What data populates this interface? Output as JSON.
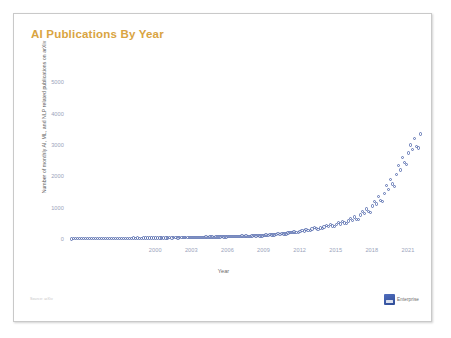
{
  "slide": {
    "title": "AI Publications By Year",
    "title_color": "#d9a441",
    "source_note": "Source: arXiv",
    "logo_text": "Enterprise",
    "logo_mark_name": "company-logo-mark",
    "background_color": "#ffffff",
    "frame_border_color": "#c9c9c9"
  },
  "chart_data": {
    "type": "scatter",
    "title": "AI Publications By Year",
    "xlabel": "Year",
    "ylabel": "Number of monthly AI, ML, and NLP related publications on arXiv",
    "marker_color": "#5d72b2",
    "marker_style": "open-circle",
    "grid": false,
    "legend": "none",
    "xlim": [
      1993,
      2022.5
    ],
    "ylim": [
      0,
      5300
    ],
    "xticks": [
      2000,
      2003,
      2006,
      2009,
      2012,
      2015,
      2018,
      2021
    ],
    "yticks": [
      0,
      1000,
      2000,
      3000,
      4000,
      5000
    ],
    "x": [
      1993.04,
      1993.21,
      1993.38,
      1993.54,
      1993.71,
      1993.88,
      1994.04,
      1994.21,
      1994.38,
      1994.54,
      1994.71,
      1994.88,
      1995.04,
      1995.21,
      1995.38,
      1995.54,
      1995.71,
      1995.88,
      1996.04,
      1996.21,
      1996.38,
      1996.54,
      1996.71,
      1996.88,
      1997.04,
      1997.21,
      1997.38,
      1997.54,
      1997.71,
      1997.88,
      1998.04,
      1998.21,
      1998.38,
      1998.54,
      1998.71,
      1998.88,
      1999.04,
      1999.21,
      1999.38,
      1999.54,
      1999.71,
      1999.88,
      2000.04,
      2000.21,
      2000.38,
      2000.54,
      2000.71,
      2000.88,
      2001.04,
      2001.21,
      2001.38,
      2001.54,
      2001.71,
      2001.88,
      2002.04,
      2002.21,
      2002.38,
      2002.54,
      2002.71,
      2002.88,
      2003.04,
      2003.21,
      2003.38,
      2003.54,
      2003.71,
      2003.88,
      2004.04,
      2004.21,
      2004.38,
      2004.54,
      2004.71,
      2004.88,
      2005.04,
      2005.21,
      2005.38,
      2005.54,
      2005.71,
      2005.88,
      2006.04,
      2006.21,
      2006.38,
      2006.54,
      2006.71,
      2006.88,
      2007.04,
      2007.21,
      2007.38,
      2007.54,
      2007.71,
      2007.88,
      2008.04,
      2008.21,
      2008.38,
      2008.54,
      2008.71,
      2008.88,
      2009.04,
      2009.21,
      2009.38,
      2009.54,
      2009.71,
      2009.88,
      2010.04,
      2010.21,
      2010.38,
      2010.54,
      2010.71,
      2010.88,
      2011.04,
      2011.21,
      2011.38,
      2011.54,
      2011.71,
      2011.88,
      2012.04,
      2012.21,
      2012.38,
      2012.54,
      2012.71,
      2012.88,
      2013.04,
      2013.21,
      2013.38,
      2013.54,
      2013.71,
      2013.88,
      2014.04,
      2014.21,
      2014.38,
      2014.54,
      2014.71,
      2014.88,
      2015.04,
      2015.21,
      2015.38,
      2015.54,
      2015.71,
      2015.88,
      2016.04,
      2016.21,
      2016.38,
      2016.54,
      2016.71,
      2016.88,
      2017.04,
      2017.21,
      2017.38,
      2017.54,
      2017.71,
      2017.88,
      2018.04,
      2018.21,
      2018.38,
      2018.54,
      2018.71,
      2018.88,
      2019.04,
      2019.21,
      2019.38,
      2019.54,
      2019.71,
      2019.88,
      2020.04,
      2020.21,
      2020.38,
      2020.54,
      2020.71,
      2020.88,
      2021.04,
      2021.21,
      2021.38,
      2021.54,
      2021.71,
      2021.88,
      2022.04
    ],
    "y": [
      6,
      8,
      7,
      9,
      10,
      8,
      11,
      12,
      10,
      13,
      12,
      11,
      14,
      15,
      13,
      16,
      15,
      14,
      17,
      18,
      16,
      19,
      18,
      17,
      20,
      22,
      19,
      23,
      21,
      20,
      24,
      26,
      23,
      27,
      25,
      24,
      28,
      30,
      27,
      31,
      29,
      28,
      32,
      35,
      31,
      36,
      34,
      33,
      37,
      40,
      36,
      41,
      39,
      38,
      43,
      46,
      42,
      47,
      45,
      44,
      49,
      52,
      48,
      54,
      51,
      50,
      56,
      60,
      55,
      62,
      58,
      57,
      64,
      68,
      63,
      70,
      66,
      65,
      73,
      78,
      72,
      80,
      76,
      75,
      84,
      90,
      83,
      92,
      88,
      86,
      96,
      103,
      95,
      106,
      100,
      99,
      112,
      125,
      118,
      135,
      128,
      122,
      145,
      168,
      152,
      175,
      160,
      155,
      190,
      215,
      198,
      228,
      205,
      200,
      245,
      280,
      258,
      300,
      268,
      262,
      320,
      365,
      340,
      310,
      350,
      330,
      380,
      430,
      395,
      460,
      410,
      400,
      470,
      520,
      480,
      560,
      505,
      495,
      580,
      650,
      600,
      700,
      630,
      615,
      760,
      880,
      810,
      960,
      870,
      850,
      1050,
      1200,
      1120,
      1350,
      1230,
      1190,
      1450,
      1700,
      1580,
      1900,
      1750,
      1680,
      2050,
      2350,
      2200,
      2600,
      2450,
      2380,
      2750,
      3000,
      2850,
      3200,
      2950,
      2900,
      3350,
      3550,
      3300,
      3450,
      2980,
      2920,
      4120
    ]
  }
}
